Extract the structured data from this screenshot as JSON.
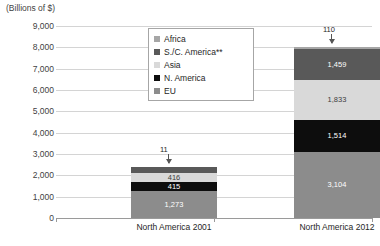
{
  "chart_data": {
    "type": "bar",
    "stacked": true,
    "title": "",
    "axis_note": "(Billions of $)",
    "xlabel": "",
    "ylabel": "(Billions of $)",
    "ylim": [
      0,
      9000
    ],
    "ytick_step": 1000,
    "grid": true,
    "legend_position": "top-center",
    "categories": [
      "North America 2001",
      "North America 2012"
    ],
    "series": [
      {
        "name": "EU",
        "color": "#8c8c8c",
        "values": [
          1273,
          3104
        ]
      },
      {
        "name": "N. America",
        "color": "#0d0d0d",
        "values": [
          415,
          1514
        ]
      },
      {
        "name": "Asia",
        "color": "#d9d9d9",
        "values": [
          416,
          1833
        ]
      },
      {
        "name": "S./C. America**",
        "color": "#595959",
        "values": [
          290,
          1459
        ]
      },
      {
        "name": "Africa",
        "color": "#a6a6a6",
        "values": [
          11,
          110
        ]
      }
    ],
    "totals": [
      2405,
      8020
    ],
    "yticks": [
      "0",
      "1,000",
      "2,000",
      "3,000",
      "4,000",
      "5,000",
      "6,000",
      "7,000",
      "8,000",
      "9,000"
    ],
    "callouts": [
      {
        "text": "11",
        "category": "North America 2001"
      },
      {
        "text": "110",
        "category": "North America 2012"
      }
    ],
    "value_labels": {
      "North America 2001": [
        "1,273",
        "415",
        "416",
        "290"
      ],
      "North America 2012": [
        "3,104",
        "1,514",
        "1,833",
        "1,459"
      ]
    }
  },
  "legend": {
    "items": [
      {
        "label": "Africa",
        "color": "#a6a6a6"
      },
      {
        "label": "S./C. America**",
        "color": "#595959"
      },
      {
        "label": "Asia",
        "color": "#d9d9d9"
      },
      {
        "label": "N. America",
        "color": "#0d0d0d"
      },
      {
        "label": "EU",
        "color": "#8c8c8c"
      }
    ]
  }
}
